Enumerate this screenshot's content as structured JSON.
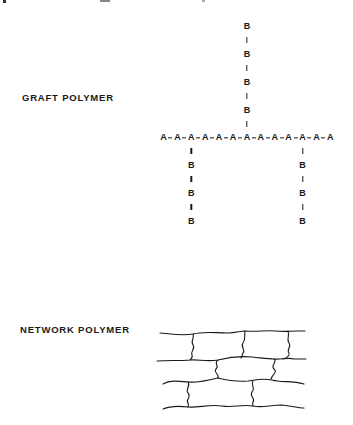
{
  "graft": {
    "label": "GRAFT POLYMER",
    "backbone_monomer": "A",
    "backbone_length": 13,
    "branch_monomer": "B",
    "backbone": [
      "A",
      "A",
      "A",
      "A",
      "A",
      "A",
      "A",
      "A",
      "A",
      "A",
      "A",
      "A",
      "A"
    ],
    "branches": [
      {
        "position": "upper",
        "attached_to_index": 7,
        "units": [
          "B",
          "B",
          "B",
          "B"
        ]
      },
      {
        "position": "lower-left",
        "attached_to_index": 3,
        "units": [
          "B",
          "B",
          "B"
        ]
      },
      {
        "position": "lower-right",
        "attached_to_index": 11,
        "units": [
          "B",
          "B",
          "B"
        ]
      }
    ]
  },
  "network": {
    "label": "NETWORK POLYMER",
    "chains": 4,
    "crosslinks": [
      {
        "between": [
          1,
          2
        ],
        "count": 3
      },
      {
        "between": [
          2,
          3
        ],
        "count": 2
      },
      {
        "between": [
          3,
          4
        ],
        "count": 2
      }
    ]
  },
  "colors": {
    "ink": "#1a1a1a",
    "background": "#ffffff"
  }
}
